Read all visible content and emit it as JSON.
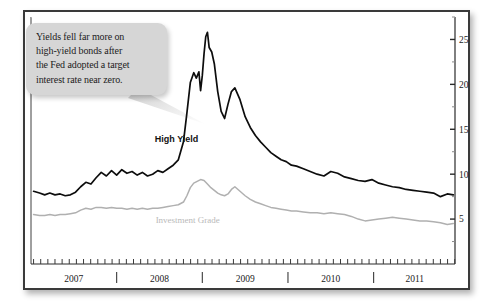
{
  "callout": {
    "text": "Yields fell far more on\nhigh-yield bonds after\nthe Fed adopted a target\ninterest rate near zero."
  },
  "colors": {
    "high_yield": "#0d0d0d",
    "investment_grade": "#b0b0b0",
    "frame": "#3a3a3a",
    "callout_bg": "#d6d6d6",
    "axis": "#2a2a2a"
  },
  "chart_data": {
    "type": "line",
    "title": "",
    "xlabel": "",
    "ylabel": "",
    "grid": false,
    "legend_position": "inline-annotation",
    "xlim": [
      2006.92,
      2011.87
    ],
    "ylim": [
      0,
      27.5
    ],
    "y_ticks_major": [
      5,
      10,
      15,
      20,
      25
    ],
    "y_ticks_minor": [
      2.5,
      7.5,
      12.5,
      17.5,
      22.5,
      27.5
    ],
    "x_tick_labels": [
      "2007",
      "2008",
      "2009",
      "2010",
      "2011"
    ],
    "x_tick_label_positions": [
      2007.42,
      2008.42,
      2009.42,
      2010.42,
      2011.4
    ],
    "x_separators": [
      2007.92,
      2008.92,
      2009.92,
      2010.92
    ],
    "x_minor_tick_interval_months": 1,
    "annotations": [
      {
        "text": "High Yield",
        "x": 2008.62,
        "y": 13.6
      },
      {
        "text": "Investment Grade",
        "x": 2008.75,
        "y": 4.6
      }
    ],
    "series": [
      {
        "name": "High Yield",
        "color": "#0d0d0d",
        "x": [
          2006.95,
          2007.02,
          2007.08,
          2007.14,
          2007.2,
          2007.26,
          2007.32,
          2007.38,
          2007.44,
          2007.5,
          2007.56,
          2007.62,
          2007.68,
          2007.74,
          2007.8,
          2007.86,
          2007.92,
          2007.98,
          2008.04,
          2008.1,
          2008.16,
          2008.22,
          2008.28,
          2008.34,
          2008.4,
          2008.46,
          2008.52,
          2008.58,
          2008.64,
          2008.7,
          2008.74,
          2008.78,
          2008.82,
          2008.85,
          2008.88,
          2008.9,
          2008.92,
          2008.94,
          2008.96,
          2008.98,
          2009.0,
          2009.03,
          2009.06,
          2009.1,
          2009.14,
          2009.18,
          2009.22,
          2009.26,
          2009.3,
          2009.36,
          2009.42,
          2009.48,
          2009.54,
          2009.6,
          2009.66,
          2009.72,
          2009.78,
          2009.84,
          2009.9,
          2009.96,
          2010.02,
          2010.1,
          2010.18,
          2010.26,
          2010.34,
          2010.42,
          2010.5,
          2010.58,
          2010.66,
          2010.74,
          2010.82,
          2010.9,
          2010.98,
          2011.06,
          2011.14,
          2011.22,
          2011.3,
          2011.38,
          2011.46,
          2011.54,
          2011.62,
          2011.7,
          2011.78,
          2011.85
        ],
        "y": [
          8.1,
          7.9,
          7.7,
          7.9,
          7.7,
          7.8,
          7.6,
          7.7,
          8.0,
          8.6,
          9.1,
          8.9,
          9.6,
          10.2,
          9.8,
          10.4,
          9.9,
          10.5,
          10.1,
          10.3,
          9.9,
          10.2,
          9.8,
          10.0,
          10.4,
          10.2,
          10.6,
          11.0,
          11.6,
          13.6,
          16.8,
          20.2,
          21.3,
          20.7,
          21.4,
          19.3,
          21.0,
          23.4,
          25.3,
          25.8,
          24.1,
          23.6,
          22.3,
          19.2,
          17.0,
          16.2,
          17.8,
          19.2,
          19.6,
          18.3,
          16.4,
          15.2,
          14.3,
          13.6,
          13.0,
          12.4,
          12.0,
          11.6,
          11.4,
          11.0,
          10.9,
          10.6,
          10.3,
          10.0,
          9.8,
          10.3,
          10.1,
          9.7,
          9.5,
          9.3,
          9.2,
          9.4,
          9.0,
          8.8,
          8.6,
          8.5,
          8.3,
          8.2,
          8.1,
          8.0,
          7.9,
          7.5,
          7.8,
          7.7
        ]
      },
      {
        "name": "Investment Grade",
        "color": "#b0b0b0",
        "x": [
          2006.95,
          2007.02,
          2007.08,
          2007.14,
          2007.2,
          2007.26,
          2007.32,
          2007.38,
          2007.44,
          2007.5,
          2007.56,
          2007.62,
          2007.68,
          2007.74,
          2007.8,
          2007.86,
          2007.92,
          2007.98,
          2008.04,
          2008.1,
          2008.16,
          2008.22,
          2008.28,
          2008.34,
          2008.4,
          2008.46,
          2008.52,
          2008.58,
          2008.64,
          2008.7,
          2008.74,
          2008.78,
          2008.82,
          2008.86,
          2008.9,
          2008.94,
          2008.98,
          2009.02,
          2009.06,
          2009.1,
          2009.14,
          2009.18,
          2009.22,
          2009.26,
          2009.3,
          2009.36,
          2009.42,
          2009.48,
          2009.54,
          2009.6,
          2009.66,
          2009.72,
          2009.78,
          2009.84,
          2009.9,
          2009.96,
          2010.02,
          2010.1,
          2010.18,
          2010.26,
          2010.34,
          2010.42,
          2010.5,
          2010.58,
          2010.66,
          2010.74,
          2010.82,
          2010.9,
          2010.98,
          2011.06,
          2011.14,
          2011.22,
          2011.3,
          2011.38,
          2011.46,
          2011.54,
          2011.62,
          2011.7,
          2011.78,
          2011.85
        ],
        "y": [
          5.5,
          5.4,
          5.4,
          5.5,
          5.4,
          5.5,
          5.5,
          5.6,
          5.7,
          6.0,
          6.2,
          6.1,
          6.3,
          6.3,
          6.2,
          6.3,
          6.2,
          6.2,
          6.1,
          6.2,
          6.1,
          6.2,
          6.1,
          6.2,
          6.2,
          6.3,
          6.4,
          6.5,
          6.6,
          6.9,
          7.6,
          8.5,
          9.0,
          9.2,
          9.4,
          9.3,
          8.9,
          8.5,
          8.2,
          7.9,
          7.7,
          7.6,
          7.8,
          8.3,
          8.6,
          8.1,
          7.6,
          7.2,
          6.9,
          6.7,
          6.5,
          6.3,
          6.2,
          6.1,
          6.0,
          5.9,
          5.9,
          5.8,
          5.7,
          5.7,
          5.6,
          5.7,
          5.6,
          5.5,
          5.3,
          5.0,
          4.8,
          4.9,
          5.0,
          5.1,
          5.2,
          5.1,
          5.0,
          4.9,
          4.8,
          4.8,
          4.7,
          4.6,
          4.4,
          4.5
        ]
      }
    ]
  }
}
